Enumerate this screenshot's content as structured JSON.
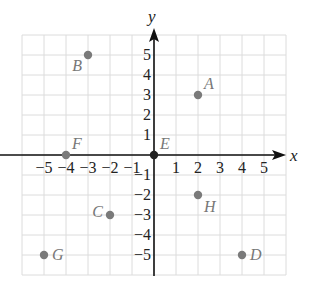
{
  "diagram": {
    "type": "coordinate-plane",
    "x_axis_label": "x",
    "y_axis_label": "y",
    "grid_range": {
      "x": [
        -6,
        6
      ],
      "y": [
        -6,
        6
      ]
    },
    "x_ticks": [
      {
        "value": -5,
        "label": "−5"
      },
      {
        "value": -4,
        "label": "−4"
      },
      {
        "value": -3,
        "label": "−3"
      },
      {
        "value": -2,
        "label": "−2"
      },
      {
        "value": -1,
        "label": "−1"
      },
      {
        "value": 1,
        "label": "1"
      },
      {
        "value": 2,
        "label": "2"
      },
      {
        "value": 3,
        "label": "3"
      },
      {
        "value": 4,
        "label": "4"
      },
      {
        "value": 5,
        "label": "5"
      }
    ],
    "y_ticks": [
      {
        "value": 5,
        "label": "5"
      },
      {
        "value": 4,
        "label": "4"
      },
      {
        "value": 3,
        "label": "3"
      },
      {
        "value": 2,
        "label": "2"
      },
      {
        "value": 1,
        "label": "1"
      },
      {
        "value": -1,
        "label": "−1"
      },
      {
        "value": -2,
        "label": "−2"
      },
      {
        "value": -3,
        "label": "−3"
      },
      {
        "value": -4,
        "label": "−4"
      },
      {
        "value": -5,
        "label": "−5"
      }
    ],
    "points": [
      {
        "name": "A",
        "x": 2,
        "y": 3,
        "label_pos": "upper-right"
      },
      {
        "name": "B",
        "x": -3,
        "y": 5,
        "label_pos": "lower-left"
      },
      {
        "name": "C",
        "x": -2,
        "y": -3,
        "label_pos": "upper-left"
      },
      {
        "name": "D",
        "x": 4,
        "y": -5,
        "label_pos": "right"
      },
      {
        "name": "E",
        "x": 0,
        "y": 0,
        "label_pos": "upper-right"
      },
      {
        "name": "F",
        "x": -4,
        "y": 0,
        "label_pos": "upper-right"
      },
      {
        "name": "G",
        "x": -5,
        "y": -5,
        "label_pos": "right"
      },
      {
        "name": "H",
        "x": 2,
        "y": -2,
        "label_pos": "lower-right"
      }
    ],
    "colors": {
      "grid": "#dcdcdc",
      "axis": "#111111",
      "point": "#7a7a7a",
      "point_label": "#777777",
      "origin_point": "#222222"
    }
  }
}
